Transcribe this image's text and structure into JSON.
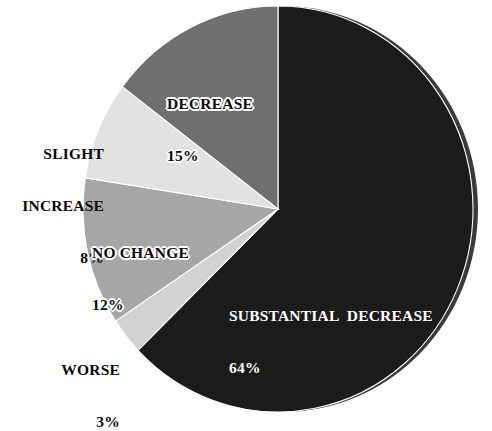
{
  "chart_data": {
    "type": "pie",
    "title": "",
    "subtitle": "",
    "xlabel": "",
    "ylabel": "",
    "legend_position": "none",
    "grid": false,
    "start_angle_deg": 0,
    "direction": "clockwise",
    "categories": [
      "SUBSTANTIAL  DECREASE",
      "WORSE",
      "NO CHANGE",
      "SLIGHT INCREASE",
      "DECREASE"
    ],
    "values": [
      64,
      3,
      12,
      8,
      15
    ],
    "value_unit": "%",
    "slices": [
      {
        "label": "SUBSTANTIAL  DECREASE",
        "value": 64,
        "value_text": "64%",
        "color": "#1b1b1b",
        "label_placement": "inside"
      },
      {
        "label": "WORSE",
        "value": 3,
        "value_text": "3%",
        "color": "#d2d2d2",
        "label_placement": "outside"
      },
      {
        "label": "NO CHANGE",
        "value": 12,
        "value_text": "12%",
        "color": "#a6a6a6",
        "label_placement": "inside"
      },
      {
        "label": "SLIGHT INCREASE",
        "value": 8,
        "value_text": "8%",
        "color": "#e2e2e2",
        "label_placement": "outside"
      },
      {
        "label": "DECREASE",
        "value": 15,
        "value_text": "15%",
        "color": "#6f6f6f",
        "label_placement": "inside"
      }
    ]
  },
  "labels": {
    "decrease": {
      "name": "DECREASE",
      "percent": "15%"
    },
    "slight_increase": {
      "line1": "SLIGHT",
      "line2": "INCREASE",
      "percent": "8%"
    },
    "no_change": {
      "name": "NO CHANGE",
      "percent": "12%"
    },
    "worse": {
      "name": "WORSE",
      "percent": "3%"
    },
    "substantial_decrease": {
      "name": "SUBSTANTIAL  DECREASE",
      "percent": "64%"
    }
  },
  "colors": {
    "background": "#ffffff",
    "substantial_decrease": "#1b1b1b",
    "worse": "#d2d2d2",
    "no_change": "#a6a6a6",
    "slight_increase": "#e2e2e2",
    "decrease": "#6f6f6f",
    "rim_shadow": "#3a3a3a",
    "slice_outline": "#ffffff",
    "text_dark": "#0a0a0a",
    "text_light": "#ffffff"
  }
}
